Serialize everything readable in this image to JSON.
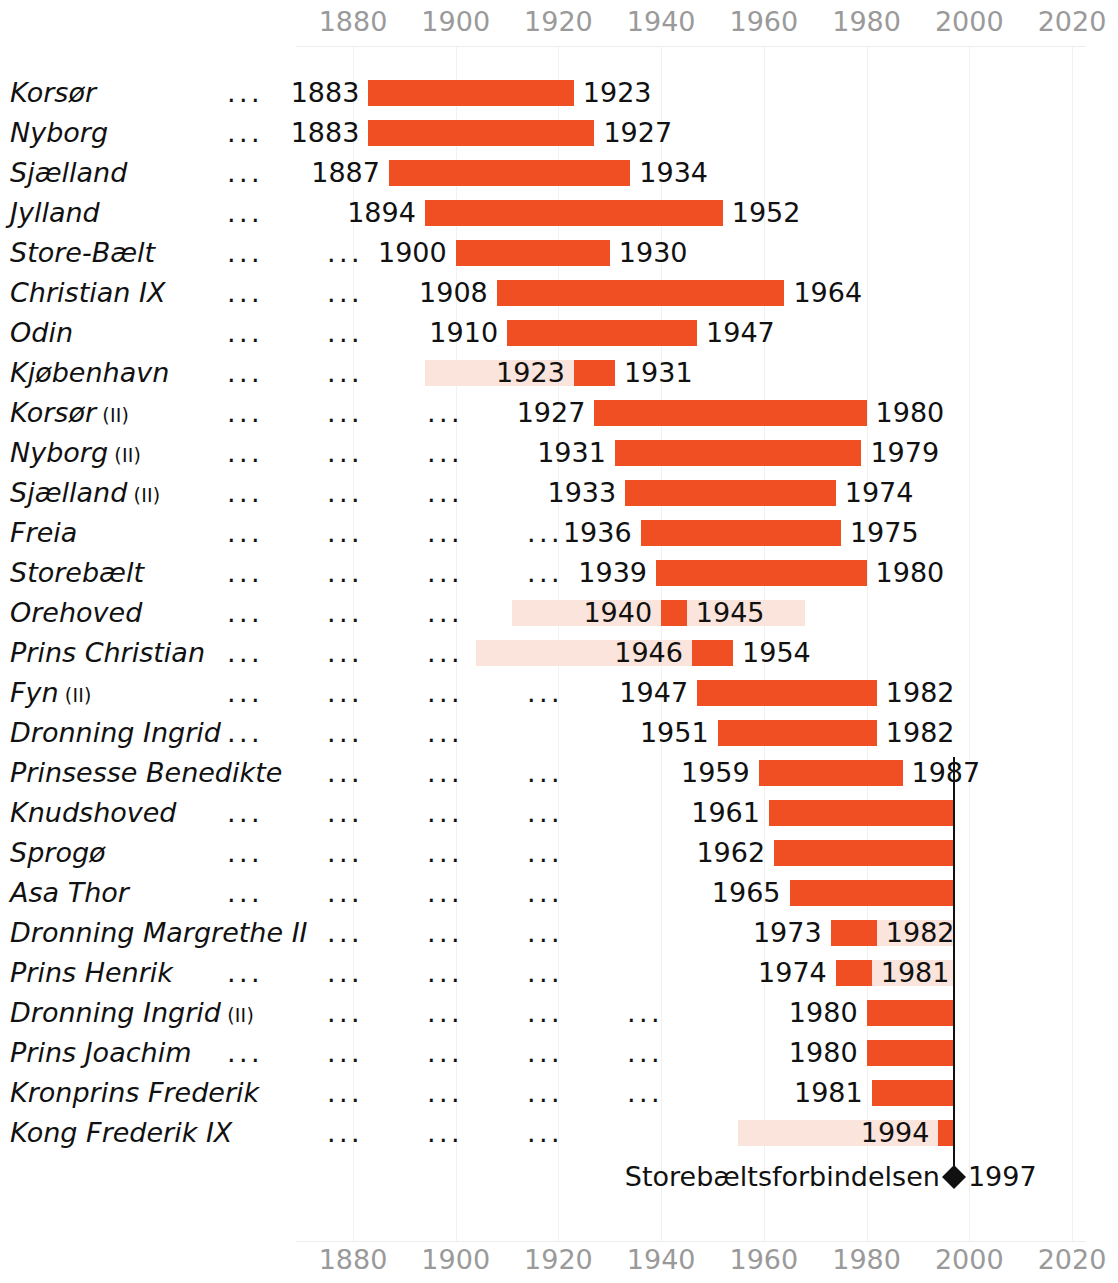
{
  "chart_data": {
    "type": "bar",
    "subtype": "gantt-timeline",
    "title": "",
    "xlabel": "",
    "ylabel": "",
    "xlim": [
      1872,
      2028
    ],
    "xticks": [
      1880,
      1900,
      1920,
      1940,
      1960,
      1980,
      2000,
      2020
    ],
    "xtick_labels": [
      "1880",
      "1900",
      "1920",
      "1940",
      "1960",
      "1980",
      "2000",
      "2020"
    ],
    "grid": true,
    "axis_positions": [
      "top",
      "bottom"
    ],
    "legend": null,
    "bar_color": "#f04e23",
    "band_color": "#fbe4db",
    "marker_color": "#111111",
    "leader_dots": "...",
    "categories": [
      "Korsør",
      "Nyborg",
      "Sjælland",
      "Jylland",
      "Store-Bælt",
      "Christian IX",
      "Odin",
      "Kjøbenhavn",
      "Korsør (II)",
      "Nyborg (II)",
      "Sjælland (II)",
      "Freia",
      "Storebælt",
      "Orehoved",
      "Prins Christian",
      "Fyn (II)",
      "Dronning Ingrid",
      "Prinsesse Benedikte",
      "Knudshoved",
      "Sprogø",
      "Asa Thor",
      "Dronning Margrethe II",
      "Prins Henrik",
      "Dronning Ingrid (II)",
      "Prins Joachim",
      "Kronprins Frederik",
      "Kong Frederik IX"
    ],
    "rows": [
      {
        "name": "Korsør",
        "suffix": "",
        "start": 1883,
        "end": 1923,
        "start_label": "1883",
        "end_label": "1923",
        "band_start": null,
        "band_end": null,
        "leaders": 2
      },
      {
        "name": "Nyborg",
        "suffix": "",
        "start": 1883,
        "end": 1927,
        "start_label": "1883",
        "end_label": "1927",
        "band_start": null,
        "band_end": null,
        "leaders": 1
      },
      {
        "name": "Sjælland",
        "suffix": "",
        "start": 1887,
        "end": 1934,
        "start_label": "1887",
        "end_label": "1934",
        "band_start": null,
        "band_end": null,
        "leaders": 1
      },
      {
        "name": "Jylland",
        "suffix": "",
        "start": 1894,
        "end": 1952,
        "start_label": "1894",
        "end_label": "1952",
        "band_start": null,
        "band_end": null,
        "leaders": 1
      },
      {
        "name": "Store-Bælt",
        "suffix": "",
        "start": 1900,
        "end": 1930,
        "start_label": "1900",
        "end_label": "1930",
        "band_start": null,
        "band_end": null,
        "leaders": 2
      },
      {
        "name": "Christian IX",
        "suffix": "",
        "start": 1908,
        "end": 1964,
        "start_label": "1908",
        "end_label": "1964",
        "band_start": null,
        "band_end": null,
        "leaders": 2
      },
      {
        "name": "Odin",
        "suffix": "",
        "start": 1910,
        "end": 1947,
        "start_label": "1910",
        "end_label": "1947",
        "band_start": null,
        "band_end": null,
        "leaders": 3
      },
      {
        "name": "Kjøbenhavn",
        "suffix": "",
        "start": 1923,
        "end": 1931,
        "start_label": "1923",
        "end_label": "1931",
        "band_start": 1894,
        "band_end": 1923,
        "leaders": 2
      },
      {
        "name": "Korsør",
        "suffix": "(II)",
        "start": 1927,
        "end": 1980,
        "start_label": "1927",
        "end_label": "1980",
        "band_start": null,
        "band_end": null,
        "leaders": 3
      },
      {
        "name": "Nyborg",
        "suffix": "(II)",
        "start": 1931,
        "end": 1979,
        "start_label": "1931",
        "end_label": "1979",
        "band_start": null,
        "band_end": null,
        "leaders": 3
      },
      {
        "name": "Sjælland",
        "suffix": "(II)",
        "start": 1933,
        "end": 1974,
        "start_label": "1933",
        "end_label": "1974",
        "band_start": null,
        "band_end": null,
        "leaders": 3
      },
      {
        "name": "Freia",
        "suffix": "",
        "start": 1936,
        "end": 1975,
        "start_label": "1936",
        "end_label": "1975",
        "band_start": null,
        "band_end": null,
        "leaders": 5
      },
      {
        "name": "Storebælt",
        "suffix": "",
        "start": 1939,
        "end": 1980,
        "start_label": "1939",
        "end_label": "1980",
        "band_start": null,
        "band_end": null,
        "leaders": 4
      },
      {
        "name": "Orehoved",
        "suffix": "",
        "start": 1940,
        "end": 1945,
        "start_label": "1940",
        "end_label": "1945",
        "band_start": 1911,
        "band_end": 1968,
        "leaders": 3
      },
      {
        "name": "Prins Christian",
        "suffix": "",
        "start": 1946,
        "end": 1954,
        "start_label": "1946",
        "end_label": "1954",
        "band_start": 1904,
        "band_end": 1946,
        "leaders": 3
      },
      {
        "name": "Fyn",
        "suffix": "(II)",
        "start": 1947,
        "end": 1982,
        "start_label": "1947",
        "end_label": "1982",
        "band_start": null,
        "band_end": null,
        "leaders": 4
      },
      {
        "name": "Dronning Ingrid",
        "suffix": "",
        "start": 1951,
        "end": 1982,
        "start_label": "1951",
        "end_label": "1982",
        "band_start": null,
        "band_end": null,
        "leaders": 3
      },
      {
        "name": "Prinsesse Benedikte",
        "suffix": "",
        "start": 1959,
        "end": 1987,
        "start_label": "1959",
        "end_label": "1987",
        "band_start": null,
        "band_end": null,
        "leaders": 4
      },
      {
        "name": "Knudshoved",
        "suffix": "",
        "start": 1961,
        "end": 1997,
        "start_label": "1961",
        "end_label": "",
        "band_start": null,
        "band_end": null,
        "leaders": 4
      },
      {
        "name": "Sprogø",
        "suffix": "",
        "start": 1962,
        "end": 1997,
        "start_label": "1962",
        "end_label": "",
        "band_start": null,
        "band_end": null,
        "leaders": 4
      },
      {
        "name": "Asa Thor",
        "suffix": "",
        "start": 1965,
        "end": 1997,
        "start_label": "1965",
        "end_label": "",
        "band_start": null,
        "band_end": null,
        "leaders": 4
      },
      {
        "name": "Dronning Margrethe II",
        "suffix": "",
        "start": 1973,
        "end": 1982,
        "start_label": "1973",
        "end_label": "1982",
        "band_start": 1973,
        "band_end": 1997,
        "leaders": 4
      },
      {
        "name": "Prins Henrik",
        "suffix": "",
        "start": 1974,
        "end": 1981,
        "start_label": "1974",
        "end_label": "1981",
        "band_start": 1974,
        "band_end": 1997,
        "leaders": 4
      },
      {
        "name": "Dronning Ingrid",
        "suffix": "(II)",
        "start": 1980,
        "end": 1997,
        "start_label": "1980",
        "end_label": "",
        "band_start": null,
        "band_end": null,
        "leaders": 5
      },
      {
        "name": "Prins Joachim",
        "suffix": "",
        "start": 1980,
        "end": 1997,
        "start_label": "1980",
        "end_label": "",
        "band_start": null,
        "band_end": null,
        "leaders": 5
      },
      {
        "name": "Kronprins Frederik",
        "suffix": "",
        "start": 1981,
        "end": 1997,
        "start_label": "1981",
        "end_label": "",
        "band_start": null,
        "band_end": null,
        "leaders": 5
      },
      {
        "name": "Kong Frederik IX",
        "suffix": "",
        "start": 1994,
        "end": 1997,
        "start_label": "1994",
        "end_label": "",
        "band_start": 1955,
        "band_end": 1994,
        "leaders": 4
      }
    ],
    "marker": {
      "label": "Storebæltsforbindelsen",
      "year": 1997,
      "year_label": "1997",
      "glyph": "diamond"
    },
    "annotations": {
      "vertical_reference_line_year": 1997
    }
  }
}
